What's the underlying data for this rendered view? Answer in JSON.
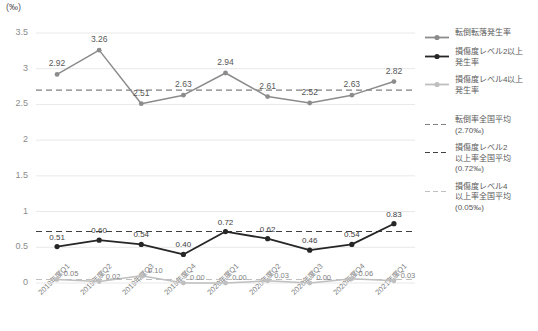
{
  "chart_data": {
    "type": "line",
    "title": "",
    "ylabel": "(‰)",
    "xlabel": "",
    "ylim": [
      0,
      3.5
    ],
    "yticks": [
      "0",
      "0.5",
      "1",
      "1.5",
      "2",
      "2.5",
      "3",
      "3.5"
    ],
    "grid": true,
    "legend_position": "right",
    "categories": [
      "2019年度Q1",
      "2019年度Q2",
      "2019年度Q3",
      "2019年度Q4",
      "2020年度Q1",
      "2020年度Q2",
      "2020年度Q3",
      "2020年度Q4",
      "2021年度Q1"
    ],
    "series": [
      {
        "name": "転倒転落発生率",
        "color": "#8c8c8c",
        "values": [
          2.92,
          3.26,
          2.51,
          2.63,
          2.94,
          2.61,
          2.52,
          2.63,
          2.82
        ],
        "labels": [
          "2.92",
          "3.26",
          "2.51",
          "2.63",
          "2.94",
          "2.61",
          "2.52",
          "2.63",
          "2.82"
        ]
      },
      {
        "name": "損傷度レベル2以上発生率",
        "color": "#262626",
        "values": [
          0.51,
          0.6,
          0.54,
          0.4,
          0.72,
          0.62,
          0.46,
          0.54,
          0.83
        ],
        "labels": [
          "0.51",
          "0.60",
          "0.54",
          "0.40",
          "0.72",
          "0.62",
          "0.46",
          "0.54",
          "0.83"
        ]
      },
      {
        "name": "損傷度レベル4以上発生率",
        "color": "#bfbfbf",
        "values": [
          0.05,
          0.02,
          0.1,
          0.0,
          0.0,
          0.03,
          0.0,
          0.06,
          0.03
        ],
        "labels": [
          "0.05",
          "0.02",
          "0.10",
          "0.00",
          "0.00",
          "0.03",
          "0.00",
          "0.06",
          "0.03"
        ]
      }
    ],
    "reference_lines": [
      {
        "name": "転倒率全国平均",
        "value": 2.7,
        "label": "2.70‰",
        "color": "#808080"
      },
      {
        "name": "損傷度レベル2以上率全国平均",
        "value": 0.72,
        "label": "0.72‰",
        "color": "#404040"
      },
      {
        "name": "損傷度レベル4以上率全国平均",
        "value": 0.05,
        "label": "0.05‰",
        "color": "#bfbfbf"
      }
    ]
  },
  "legend": {
    "items": [
      {
        "label": "転倒転落発生率",
        "type": "solid-marker",
        "color": "#8c8c8c"
      },
      {
        "label": "損傷度レベル2以上\n発生率",
        "line1": "損傷度レベル2以上",
        "line2": "発生率",
        "type": "solid-marker",
        "color": "#262626"
      },
      {
        "label": "損傷度レベル4以上\n発生率",
        "line1": "損傷度レベル4以上",
        "line2": "発生率",
        "type": "solid-marker",
        "color": "#bfbfbf"
      },
      {
        "line1": "転倒率全国平均",
        "line2": "(2.70‰)",
        "type": "dashed",
        "color": "#808080"
      },
      {
        "line1": "損傷度レベル2",
        "line2": "以上率全国平均",
        "line3": "(0.72‰)",
        "type": "dashed",
        "color": "#404040"
      },
      {
        "line1": "損傷度レベル4",
        "line2": "以上率全国平均",
        "line3": "(0.05‰)",
        "type": "dashed",
        "color": "#bfbfbf"
      }
    ]
  }
}
